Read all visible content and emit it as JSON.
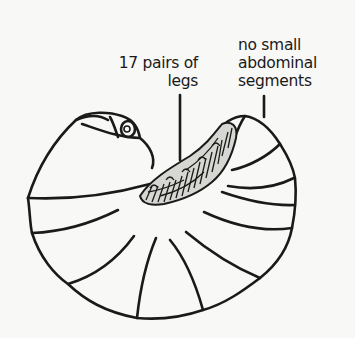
{
  "figure": {
    "line_color": "#1a1a1a",
    "background_color": "#f8f8f6",
    "annotations": [
      {
        "id": "legs",
        "lines": [
          "17 pairs of",
          "legs"
        ]
      },
      {
        "id": "segments",
        "lines": [
          "no small",
          "abdominal",
          "segments"
        ]
      }
    ]
  }
}
